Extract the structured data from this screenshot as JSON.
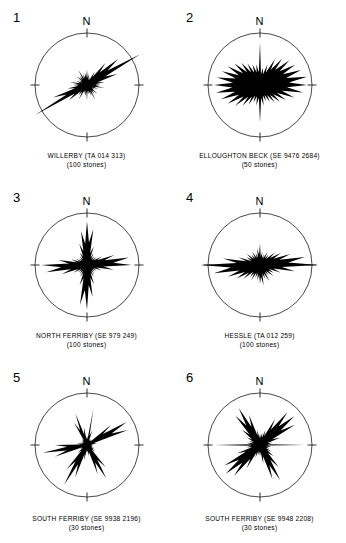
{
  "figure": {
    "north_label": "N",
    "circle_color": "#1a1a1a",
    "rose_fill_color": "#000000",
    "background_color": "#ffffff"
  },
  "panels": [
    {
      "number": "1",
      "site": "WILLERBY",
      "grid_ref": "(TA 014 313)",
      "caption_line1": "WILLERBY   (TA 014 313)",
      "caption_line2": "(100 stones)",
      "sample_count": 100,
      "sample_label": "(100 stones)"
    },
    {
      "number": "2",
      "site": "ELLOUGHTON BECK",
      "grid_ref": "(SE 9476 2684)",
      "caption_line1": "ELLOUGHTON BECK  (SE 9476 2684)",
      "caption_line2": "(50 stones)",
      "sample_count": 50,
      "sample_label": "(50 stones)"
    },
    {
      "number": "3",
      "site": "NORTH FERRIBY",
      "grid_ref": "(SE 979 249)",
      "caption_line1": "NORTH FERRIBY   (SE 979 249)",
      "caption_line2": "(100 stones)",
      "sample_count": 100,
      "sample_label": "(100 stones)"
    },
    {
      "number": "4",
      "site": "HESSLE",
      "grid_ref": "(TA 012 259)",
      "caption_line1": "HESSLE   (TA 012 259)",
      "caption_line2": "(100 stones)",
      "sample_count": 100,
      "sample_label": "(100 stones)"
    },
    {
      "number": "5",
      "site": "SOUTH FERRIBY",
      "grid_ref": "(SE 9938 2196)",
      "caption_line1": "SOUTH FERRIBY  (SE 9938 2196)",
      "caption_line2": "(30 stones)",
      "sample_count": 30,
      "sample_label": "(30 stones)"
    },
    {
      "number": "6",
      "site": "SOUTH FERRIBY",
      "grid_ref": "(SE 9948 2208)",
      "caption_line1": "SOUTH FERRIBY  (SE 9948 2208)",
      "caption_line2": "(30 stones)",
      "sample_count": 30,
      "sample_label": "(30 stones)"
    }
  ],
  "chart_data": [
    {
      "type": "rose",
      "panel": "1",
      "title": "WILLERBY   (TA 014 313)",
      "n": 100,
      "bin_degrees": 10,
      "max_radius": 1.0,
      "note": "Strongly bimodal NE-SW fabric; principal mode at 060-240 degrees extends past the circle margin.",
      "directions_deg": [
        0,
        10,
        20,
        30,
        40,
        50,
        60,
        70,
        80,
        90,
        100,
        110,
        120,
        130,
        140,
        150,
        160,
        170,
        180,
        190,
        200,
        210,
        220,
        230,
        240,
        250,
        260,
        270,
        280,
        290,
        300,
        310,
        320,
        330,
        340,
        350
      ],
      "values": [
        0.3,
        0.22,
        0.16,
        0.3,
        0.55,
        0.78,
        1.18,
        0.62,
        0.34,
        0.26,
        0.34,
        0.22,
        0.18,
        0.26,
        0.22,
        0.32,
        0.22,
        0.18,
        0.3,
        0.22,
        0.18,
        0.32,
        0.26,
        0.46,
        1.15,
        0.7,
        0.38,
        0.26,
        0.34,
        0.22,
        0.18,
        0.26,
        0.22,
        0.34,
        0.22,
        0.24
      ]
    },
    {
      "type": "rose",
      "panel": "2",
      "title": "ELLOUGHTON BECK  (SE 9476 2684)",
      "n": 50,
      "bin_degrees": 10,
      "max_radius": 1.0,
      "note": "Broad E-W girdle filling most of the circle, with a narrow spike due north and due south.",
      "directions_deg": [
        0,
        10,
        20,
        30,
        40,
        50,
        60,
        70,
        80,
        90,
        100,
        110,
        120,
        130,
        140,
        150,
        160,
        170,
        180,
        190,
        200,
        210,
        220,
        230,
        240,
        250,
        260,
        270,
        280,
        290,
        300,
        310,
        320,
        330,
        340,
        350
      ],
      "values": [
        0.82,
        0.34,
        0.42,
        0.58,
        0.66,
        0.74,
        0.78,
        0.84,
        0.92,
        0.9,
        0.84,
        0.7,
        0.58,
        0.5,
        0.44,
        0.38,
        0.34,
        0.4,
        0.72,
        0.4,
        0.36,
        0.44,
        0.52,
        0.62,
        0.72,
        0.8,
        0.86,
        0.88,
        0.84,
        0.78,
        0.72,
        0.64,
        0.56,
        0.48,
        0.42,
        0.4
      ]
    },
    {
      "type": "rose",
      "panel": "3",
      "title": "NORTH FERRIBY   (SE 979 249)",
      "n": 100,
      "bin_degrees": 10,
      "max_radius": 1.0,
      "note": "Four-pointed star: strong modes near N/NNE, ENE, S/SSW and WSW.",
      "directions_deg": [
        0,
        10,
        20,
        30,
        40,
        50,
        60,
        70,
        80,
        90,
        100,
        110,
        120,
        130,
        140,
        150,
        160,
        170,
        180,
        190,
        200,
        210,
        220,
        230,
        240,
        250,
        260,
        270,
        280,
        290,
        300,
        310,
        320,
        330,
        340,
        350
      ],
      "values": [
        0.84,
        0.7,
        0.38,
        0.26,
        0.22,
        0.24,
        0.34,
        0.56,
        0.82,
        0.86,
        0.52,
        0.3,
        0.22,
        0.2,
        0.22,
        0.26,
        0.4,
        0.62,
        0.86,
        0.78,
        0.42,
        0.26,
        0.22,
        0.22,
        0.3,
        0.52,
        0.8,
        0.88,
        0.56,
        0.32,
        0.24,
        0.2,
        0.22,
        0.28,
        0.44,
        0.66
      ]
    },
    {
      "type": "rose",
      "panel": "4",
      "title": "HESSLE   (TA 012 259)",
      "n": 100,
      "bin_degrees": 10,
      "max_radius": 1.0,
      "note": "Strong E-W preferred orientation; the 090-270 mode reaches and passes the circle edge.",
      "directions_deg": [
        0,
        10,
        20,
        30,
        40,
        50,
        60,
        70,
        80,
        90,
        100,
        110,
        120,
        130,
        140,
        150,
        160,
        170,
        180,
        190,
        200,
        210,
        220,
        230,
        240,
        250,
        260,
        270,
        280,
        290,
        300,
        310,
        320,
        330,
        340,
        350
      ],
      "values": [
        0.42,
        0.26,
        0.22,
        0.3,
        0.26,
        0.38,
        0.46,
        0.62,
        0.88,
        1.12,
        0.68,
        0.42,
        0.3,
        0.34,
        0.26,
        0.36,
        0.28,
        0.4,
        0.36,
        0.3,
        0.26,
        0.34,
        0.3,
        0.42,
        0.52,
        0.66,
        0.9,
        1.15,
        0.72,
        0.44,
        0.3,
        0.34,
        0.26,
        0.3,
        0.24,
        0.32
      ]
    },
    {
      "type": "rose",
      "panel": "5",
      "title": "SOUTH FERRIBY  (SE 9938 2196)",
      "n": 30,
      "bin_degrees": 10,
      "max_radius": 1.0,
      "note": "Spoke-like pattern with separate narrow petals at NNE, ENE, SSE, SSW, WSW and NNW.",
      "directions_deg": [
        0,
        10,
        20,
        30,
        40,
        50,
        60,
        70,
        80,
        90,
        100,
        110,
        120,
        130,
        140,
        150,
        160,
        170,
        180,
        190,
        200,
        210,
        220,
        230,
        240,
        250,
        260,
        270,
        280,
        290,
        300,
        310,
        320,
        330,
        340,
        350
      ],
      "values": [
        0.18,
        0.72,
        0.3,
        0.14,
        0.14,
        0.6,
        0.88,
        0.84,
        0.2,
        0.12,
        0.12,
        0.14,
        0.18,
        0.2,
        0.56,
        0.74,
        0.6,
        0.22,
        0.16,
        0.3,
        0.66,
        0.88,
        0.62,
        0.24,
        0.16,
        0.66,
        0.86,
        0.62,
        0.2,
        0.14,
        0.12,
        0.14,
        0.16,
        0.5,
        0.64,
        0.34
      ]
    },
    {
      "type": "rose",
      "panel": "6",
      "title": "SOUTH FERRIBY  (SE 9948 2208)",
      "n": 30,
      "bin_degrees": 10,
      "max_radius": 1.0,
      "note": "Broad spokes toward NE, NNW, SW and SSE with a thin E-W tail reaching the circle edge.",
      "directions_deg": [
        0,
        10,
        20,
        30,
        40,
        50,
        60,
        70,
        80,
        90,
        100,
        110,
        120,
        130,
        140,
        150,
        160,
        170,
        180,
        190,
        200,
        210,
        220,
        230,
        240,
        250,
        260,
        270,
        280,
        290,
        300,
        310,
        320,
        330,
        340,
        350
      ],
      "values": [
        0.22,
        0.24,
        0.3,
        0.58,
        0.82,
        0.86,
        0.78,
        0.42,
        0.24,
        0.86,
        0.22,
        0.2,
        0.26,
        0.34,
        0.56,
        0.78,
        0.7,
        0.36,
        0.22,
        0.2,
        0.26,
        0.52,
        0.78,
        0.86,
        0.8,
        0.48,
        0.26,
        0.88,
        0.26,
        0.22,
        0.3,
        0.46,
        0.74,
        0.82,
        0.62,
        0.3
      ]
    }
  ]
}
